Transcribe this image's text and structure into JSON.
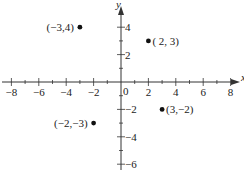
{
  "chart_data": {
    "type": "scatter",
    "title": "",
    "xlabel": "x",
    "ylabel": "y",
    "xlim": [
      -8.5,
      8.5
    ],
    "ylim": [
      -6.5,
      5.5
    ],
    "grid": false,
    "x_ticks": [
      -8,
      -6,
      -4,
      -2,
      0,
      2,
      4,
      6,
      8
    ],
    "y_ticks": [
      -6,
      -4,
      -2,
      2,
      4
    ],
    "x_tick_labels": [
      "−8",
      "−6",
      "−4",
      "−2",
      "0",
      "2",
      "4",
      "6",
      "8"
    ],
    "y_tick_labels": [
      "−6",
      "−4",
      "−2",
      "2",
      "4"
    ],
    "points": [
      {
        "x": -3,
        "y": 4,
        "label": "(−3,4)"
      },
      {
        "x": 2,
        "y": 3,
        "label": "( 2, 3)"
      },
      {
        "x": -2,
        "y": -3,
        "label": "(−2,−3)"
      },
      {
        "x": 3,
        "y": -2,
        "label": "(3,−2)"
      }
    ]
  },
  "axes": {
    "x_name": "x",
    "y_name": "y",
    "origin_label": "0"
  }
}
